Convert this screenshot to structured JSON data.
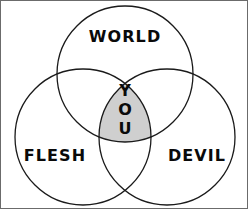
{
  "figure": {
    "type": "venn-diagram",
    "background_color": "#ffffff",
    "border_color": "#6b6b6b",
    "stroke_color": "#1a1a1a",
    "intersection_fill": "#cfcfcf",
    "text_color": "#0a0a0a"
  },
  "sets": [
    {
      "id": "world",
      "label": "WORLD",
      "position": "top",
      "cx": 124,
      "cy": 73,
      "r": 68,
      "label_x": 124,
      "label_y": 41
    },
    {
      "id": "flesh",
      "label": "FLESH",
      "position": "bottom-left",
      "cx": 82,
      "cy": 136,
      "r": 68,
      "label_x": 54,
      "label_y": 160
    },
    {
      "id": "devil",
      "label": "DEVIL",
      "position": "bottom-right",
      "cx": 166,
      "cy": 136,
      "r": 68,
      "label_x": 196,
      "label_y": 160
    }
  ],
  "intersection": {
    "id": "you",
    "label": "YOU",
    "letters": [
      "Y",
      "O",
      "U"
    ],
    "letter_x": 124,
    "letter_y": [
      95,
      114,
      133
    ],
    "fill": "#cfcfcf"
  }
}
